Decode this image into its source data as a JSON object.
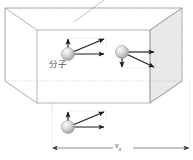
{
  "figure": {
    "title": "",
    "labels": {
      "molecule": "分子",
      "velocity_x_symbol": "v",
      "velocity_x_subscript": "x"
    },
    "colors": {
      "outline": "#9a9a9a",
      "dashed": "#b5b5b5",
      "shaded_face": "#e9e9e9",
      "arrow": "#1a1a1a",
      "dotted_guide": "#c0c0c0",
      "sphere_light": "#f2f2f2",
      "sphere_mid": "#c9c9c9",
      "sphere_dark": "#8f8f8f",
      "text": "#555555"
    },
    "box": {
      "front_face": {
        "x": 37,
        "y": 30,
        "width": 113,
        "height": 73
      },
      "depth_offset": {
        "dx": -32,
        "dy": -22
      }
    },
    "molecules": [
      {
        "name": "molecule-1",
        "cx": 68,
        "cy": 54,
        "r": 6.5,
        "vectors": [
          {
            "name": "vector-up",
            "dx": 0,
            "dy": -16,
            "style": "solid"
          },
          {
            "name": "vector-diagonal",
            "dx": 38,
            "dy": -16,
            "style": "solid"
          },
          {
            "name": "vector-horizontal",
            "dx": 38,
            "dy": 0,
            "style": "solid"
          }
        ]
      },
      {
        "name": "molecule-2",
        "cx": 122,
        "cy": 52,
        "r": 6.5,
        "vectors": [
          {
            "name": "vector-horizontal",
            "dx": 34,
            "dy": 0,
            "style": "solid"
          },
          {
            "name": "vector-down",
            "dx": 0,
            "dy": 16,
            "style": "solid"
          },
          {
            "name": "vector-diagonal",
            "dx": 34,
            "dy": 16,
            "style": "solid"
          }
        ]
      },
      {
        "name": "molecule-3",
        "cx": 68,
        "cy": 127,
        "r": 6.5,
        "vectors": [
          {
            "name": "vector-up",
            "dx": 0,
            "dy": -16,
            "style": "solid"
          },
          {
            "name": "vector-diagonal",
            "dx": 38,
            "dy": -16,
            "style": "solid"
          },
          {
            "name": "vector-horizontal",
            "dx": 38,
            "dy": 0,
            "style": "solid"
          }
        ]
      }
    ],
    "dimension_line": {
      "name": "vx-dimension",
      "x_start": 52,
      "x_end": 190,
      "y": 148,
      "arrowheads": "both"
    },
    "leader_line": {
      "name": "top-leader-line",
      "x1": 74,
      "y1": 22,
      "x2": 104,
      "y2": 0
    }
  }
}
